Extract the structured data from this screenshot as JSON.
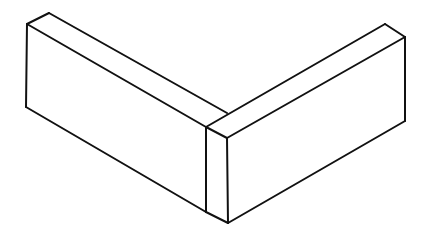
{
  "figure": {
    "background": "#ffffff",
    "stroke_color": "#111111",
    "stroke_width": 2
  },
  "shapes": {
    "left_block": {
      "edges": [
        [
          [
            27,
            24
          ],
          [
            49,
            13
          ]
        ],
        [
          [
            49,
            13
          ],
          [
            227,
            113
          ]
        ],
        [
          [
            27,
            24
          ],
          [
            206,
            127
          ]
        ],
        [
          [
            27,
            24
          ],
          [
            26,
            107
          ]
        ],
        [
          [
            26,
            107
          ],
          [
            206,
            212
          ]
        ]
      ]
    },
    "right_block": {
      "edges": [
        [
          [
            206,
            127
          ],
          [
            385,
            24
          ]
        ],
        [
          [
            385,
            24
          ],
          [
            405,
            37
          ]
        ],
        [
          [
            405,
            37
          ],
          [
            227,
            138
          ]
        ],
        [
          [
            206,
            127
          ],
          [
            227,
            138
          ]
        ],
        [
          [
            405,
            37
          ],
          [
            405,
            121
          ]
        ],
        [
          [
            405,
            121
          ],
          [
            228,
            223
          ]
        ],
        [
          [
            206,
            127
          ],
          [
            206,
            212
          ]
        ],
        [
          [
            227,
            138
          ],
          [
            228,
            223
          ]
        ],
        [
          [
            206,
            212
          ],
          [
            228,
            223
          ]
        ]
      ]
    }
  }
}
